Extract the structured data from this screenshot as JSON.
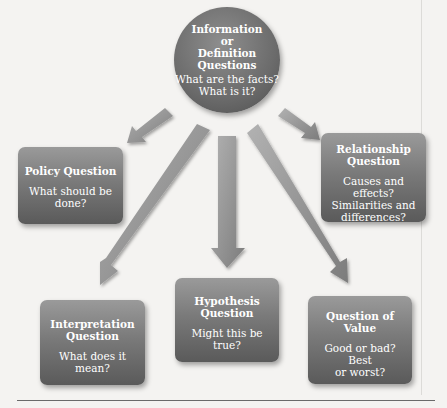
{
  "diagram": {
    "center": {
      "title_lines": [
        "Information",
        "or",
        "Definition",
        "Questions"
      ],
      "subtitle_lines": [
        "What are the facts?",
        "What is it?"
      ]
    },
    "nodes": [
      {
        "id": "policy",
        "title_lines": [
          "Policy Question"
        ],
        "subtitle_lines": [
          "What should be",
          "done?"
        ]
      },
      {
        "id": "relationship",
        "title_lines": [
          "Relationship",
          "Question"
        ],
        "subtitle_lines": [
          "Causes and effects?",
          "Similarities and",
          "differences?"
        ]
      },
      {
        "id": "interpretation",
        "title_lines": [
          "Interpretation",
          "Question"
        ],
        "subtitle_lines": [
          "What does it mean?"
        ]
      },
      {
        "id": "hypothesis",
        "title_lines": [
          "Hypothesis",
          "Question"
        ],
        "subtitle_lines": [
          "Might this be true?"
        ]
      },
      {
        "id": "value",
        "title_lines": [
          "Question of",
          "Value"
        ],
        "subtitle_lines": [
          "Good or bad? Best",
          "or worst?"
        ]
      }
    ],
    "edges": [
      {
        "from": "center",
        "to": "policy"
      },
      {
        "from": "center",
        "to": "relationship"
      },
      {
        "from": "center",
        "to": "interpretation"
      },
      {
        "from": "center",
        "to": "hypothesis"
      },
      {
        "from": "center",
        "to": "value"
      }
    ],
    "colors": {
      "node_fill": "#7a7a7a",
      "arrow_fill": "#9a9a9a",
      "text": "#ffffff",
      "background": "#f4f3f1"
    }
  }
}
